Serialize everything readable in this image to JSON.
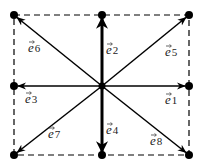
{
  "diagram": {
    "center": {
      "x": 102,
      "y": 86
    },
    "colors": {
      "line": "#000000",
      "dashed_box": "#000000",
      "label": "#222222",
      "background": "#ffffff"
    },
    "box": {
      "left": 14,
      "top": 15,
      "right": 189,
      "bottom": 155
    },
    "vectors": [
      {
        "id": "e1",
        "label": "e",
        "sub": "1",
        "to": {
          "x": 189,
          "y": 86
        },
        "thick": false,
        "label_pos": {
          "x": 165,
          "y": 104
        }
      },
      {
        "id": "e2",
        "label": "e",
        "sub": "2",
        "to": {
          "x": 102,
          "y": 15
        },
        "thick": true,
        "label_pos": {
          "x": 106,
          "y": 54
        }
      },
      {
        "id": "e3",
        "label": "e",
        "sub": "3",
        "to": {
          "x": 14,
          "y": 86
        },
        "thick": false,
        "label_pos": {
          "x": 25,
          "y": 103
        }
      },
      {
        "id": "e4",
        "label": "e",
        "sub": "4",
        "to": {
          "x": 102,
          "y": 155
        },
        "thick": true,
        "label_pos": {
          "x": 106,
          "y": 134
        }
      },
      {
        "id": "e5",
        "label": "e",
        "sub": "5",
        "to": {
          "x": 189,
          "y": 15
        },
        "thick": false,
        "label_pos": {
          "x": 165,
          "y": 56
        }
      },
      {
        "id": "e6",
        "label": "e",
        "sub": "6",
        "to": {
          "x": 14,
          "y": 15
        },
        "thick": false,
        "label_pos": {
          "x": 28,
          "y": 52
        }
      },
      {
        "id": "e7",
        "label": "e",
        "sub": "7",
        "to": {
          "x": 14,
          "y": 155
        },
        "thick": false,
        "label_pos": {
          "x": 48,
          "y": 138
        }
      },
      {
        "id": "e8",
        "label": "e",
        "sub": "8",
        "to": {
          "x": 189,
          "y": 155
        },
        "thick": false,
        "label_pos": {
          "x": 150,
          "y": 145
        }
      }
    ]
  }
}
